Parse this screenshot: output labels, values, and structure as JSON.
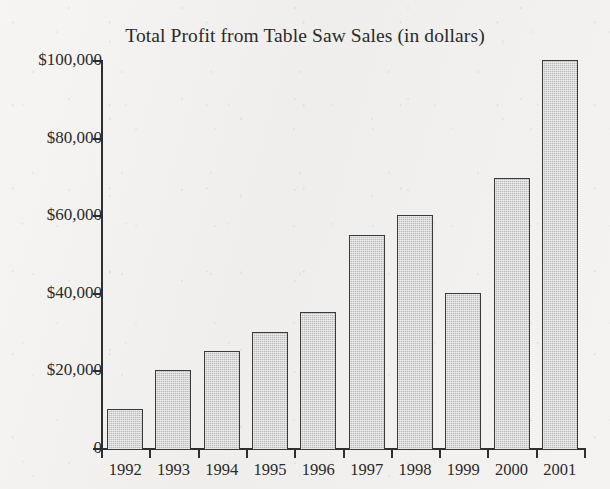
{
  "chart_data": {
    "type": "bar",
    "title": "Total Profit from Table Saw Sales (in dollars)",
    "xlabel": "",
    "ylabel": "",
    "categories": [
      "1992",
      "1993",
      "1994",
      "1995",
      "1996",
      "1997",
      "1998",
      "1999",
      "2000",
      "2001"
    ],
    "values": [
      10000,
      20000,
      25000,
      30000,
      35000,
      55000,
      60000,
      40000,
      69500,
      100000
    ],
    "ylim": [
      0,
      100000
    ],
    "ytick_values": [
      100000,
      80000,
      60000,
      40000,
      20000,
      0
    ],
    "ytick_labels": [
      "$100,000",
      "$80,000",
      "$60,000",
      "$40,000",
      "$20,000",
      "0"
    ],
    "grid": false,
    "legend": null,
    "bar_fill_color": "#bcbcbc",
    "bar_edge_color": "#3a3a3a",
    "axis_color": "#2f2f2f",
    "background_color": "#f3f2f0",
    "text_color": "#2a2a2a"
  }
}
